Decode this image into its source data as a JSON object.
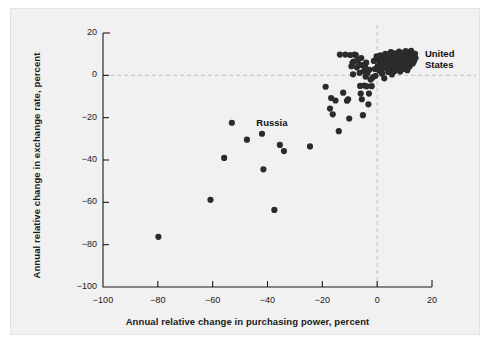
{
  "chart_data": {
    "type": "scatter",
    "title": "",
    "xlabel": "Annual relative change in purchasing power, percent",
    "ylabel": "Annual relative change in exchange rate, percent",
    "xlim": [
      -100,
      20
    ],
    "ylim": [
      -100,
      20
    ],
    "xticks": [
      -100,
      -80,
      -60,
      -40,
      -20,
      0,
      20
    ],
    "yticks": [
      20,
      0,
      -20,
      -40,
      -60,
      -80,
      -100
    ],
    "xtick_labels": [
      "-100",
      "-80",
      "-60",
      "-40",
      "-20",
      "0",
      "20"
    ],
    "ytick_labels": [
      "20",
      "0",
      "-20",
      "-40",
      "-60",
      "-80",
      "-100"
    ],
    "grid": false,
    "reference_lines": [
      {
        "axis": "y",
        "value": 0,
        "style": "dashed"
      },
      {
        "axis": "x",
        "value": 0,
        "style": "dashed"
      }
    ],
    "legend": null,
    "marker": {
      "shape": "circle",
      "color": "#2b2b2b",
      "size_px": 4.1
    },
    "annotations": [
      {
        "text": "Russia",
        "x": -47,
        "y": -22.5,
        "anchor": "left"
      },
      {
        "text": "United States",
        "x": 14.5,
        "y": 9.5,
        "anchor": "left",
        "lines": [
          "United",
          "States"
        ]
      }
    ],
    "points": [
      [
        -79.8,
        -76.3
      ],
      [
        -60.8,
        -58.8
      ],
      [
        -55.8,
        -39.0
      ],
      [
        -53.0,
        -22.4
      ],
      [
        -47.5,
        -30.4
      ],
      [
        -42.0,
        -27.6
      ],
      [
        -41.5,
        -44.4
      ],
      [
        -37.5,
        -63.6
      ],
      [
        -35.5,
        -32.9
      ],
      [
        -34.0,
        -35.8
      ],
      [
        -24.5,
        -33.6
      ],
      [
        -18.8,
        -5.4
      ],
      [
        -17.2,
        -15.7
      ],
      [
        -16.8,
        -10.7
      ],
      [
        -16.2,
        -18.4
      ],
      [
        -15.2,
        -11.9
      ],
      [
        -14.0,
        -26.4
      ],
      [
        -13.6,
        9.8
      ],
      [
        -12.4,
        -8.2
      ],
      [
        -11.6,
        9.8
      ],
      [
        -11.0,
        -12.0
      ],
      [
        -10.6,
        -11.3
      ],
      [
        -10.2,
        -20.4
      ],
      [
        -9.8,
        9.6
      ],
      [
        -9.4,
        4.3
      ],
      [
        -9.0,
        5.9
      ],
      [
        -8.8,
        0.5
      ],
      [
        -8.6,
        6.5
      ],
      [
        -8.2,
        9.8
      ],
      [
        -7.8,
        9.6
      ],
      [
        -7.4,
        3.8
      ],
      [
        -7.0,
        7.3
      ],
      [
        -6.6,
        5.0
      ],
      [
        -6.4,
        1.2
      ],
      [
        -6.2,
        -5.0
      ],
      [
        -6.0,
        -8.6
      ],
      [
        -5.8,
        8.2
      ],
      [
        -5.6,
        -11.3
      ],
      [
        -5.4,
        4.8
      ],
      [
        -5.2,
        -18.8
      ],
      [
        -4.8,
        2.0
      ],
      [
        -4.6,
        -4.8
      ],
      [
        -4.4,
        4.0
      ],
      [
        -4.2,
        -0.6
      ],
      [
        -4.0,
        6.0
      ],
      [
        -3.8,
        -5.2
      ],
      [
        -3.6,
        1.0
      ],
      [
        -3.2,
        -13.7
      ],
      [
        -3.0,
        -8.6
      ],
      [
        -2.8,
        2.6
      ],
      [
        -2.4,
        -2.0
      ],
      [
        -2.0,
        -5.1
      ],
      [
        -1.6,
        -1.0
      ],
      [
        -1.2,
        6.8
      ],
      [
        -0.8,
        3.0
      ],
      [
        -0.6,
        -0.2
      ],
      [
        -0.2,
        9.0
      ],
      [
        0.2,
        4.4
      ],
      [
        0.6,
        7.0
      ],
      [
        0.8,
        2.2
      ],
      [
        1.2,
        9.4
      ],
      [
        1.4,
        5.6
      ],
      [
        1.8,
        0.8
      ],
      [
        2.0,
        8.2
      ],
      [
        2.2,
        3.4
      ],
      [
        2.6,
        -1.4
      ],
      [
        2.8,
        6.2
      ],
      [
        3.0,
        10.2
      ],
      [
        3.4,
        4.0
      ],
      [
        3.6,
        7.8
      ],
      [
        4.0,
        1.6
      ],
      [
        4.2,
        9.0
      ],
      [
        4.4,
        5.2
      ],
      [
        4.8,
        2.8
      ],
      [
        5.0,
        11.0
      ],
      [
        5.2,
        6.6
      ],
      [
        5.4,
        0.4
      ],
      [
        5.8,
        8.6
      ],
      [
        6.0,
        4.6
      ],
      [
        6.2,
        10.4
      ],
      [
        6.4,
        2.0
      ],
      [
        6.8,
        7.2
      ],
      [
        7.0,
        5.4
      ],
      [
        7.2,
        9.8
      ],
      [
        7.4,
        3.2
      ],
      [
        7.8,
        6.0
      ],
      [
        8.0,
        11.2
      ],
      [
        8.2,
        8.0
      ],
      [
        8.4,
        1.8
      ],
      [
        8.8,
        4.8
      ],
      [
        9.0,
        9.6
      ],
      [
        9.2,
        6.8
      ],
      [
        9.4,
        3.0
      ],
      [
        9.8,
        10.6
      ],
      [
        10.0,
        7.6
      ],
      [
        10.2,
        5.0
      ],
      [
        10.4,
        11.4
      ],
      [
        10.8,
        8.4
      ],
      [
        11.0,
        2.4
      ],
      [
        11.2,
        6.2
      ],
      [
        11.4,
        9.2
      ],
      [
        11.8,
        4.2
      ],
      [
        12.0,
        10.8
      ],
      [
        12.2,
        7.0
      ],
      [
        12.4,
        11.6
      ],
      [
        12.8,
        8.8
      ],
      [
        13.0,
        5.6
      ],
      [
        13.2,
        9.8
      ],
      [
        13.4,
        6.6
      ],
      [
        13.8,
        10.2
      ],
      [
        14.0,
        8.2
      ]
    ]
  },
  "axes": {
    "x_title": "Annual relative change in purchasing power, percent",
    "y_title": "Annual relative change in exchange rate, percent"
  },
  "labels": {
    "russia": "Russia",
    "united_states_line1": "United",
    "united_states_line2": "States"
  },
  "colors": {
    "marker": "#2b2b2b",
    "axis": "#1a1a1a",
    "reference_line": "#c0c0c0",
    "panel_background": "#f1f1f1",
    "page_background": "#ffffff"
  }
}
